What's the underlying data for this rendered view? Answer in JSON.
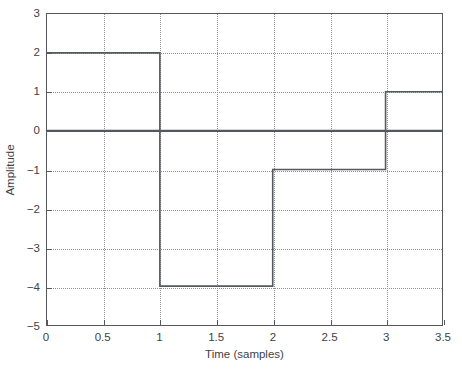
{
  "chart_data": {
    "type": "line",
    "subtype": "step",
    "title": "",
    "xlabel": "Time (samples)",
    "ylabel": "Amplitude",
    "xlim": [
      0,
      3.5
    ],
    "ylim": [
      -5,
      3
    ],
    "grid": true,
    "legend": "none",
    "xticks": [
      0,
      0.5,
      1,
      1.5,
      2,
      2.5,
      3,
      3.5
    ],
    "xtick_labels": [
      "0",
      "0.5",
      "1",
      "1.5",
      "2",
      "2.5",
      "3",
      "3.5"
    ],
    "yticks": [
      3,
      2,
      1,
      0,
      -1,
      -2,
      -3,
      -4,
      -5
    ],
    "ytick_labels": [
      "3",
      "2",
      "1",
      "0",
      "−1",
      "−2",
      "−3",
      "−4",
      "−5"
    ],
    "series": [
      {
        "name": "step-signal",
        "color": "#55585c",
        "steps": [
          {
            "x_start": 0,
            "x_end": 1,
            "value": 2
          },
          {
            "x_start": 1,
            "x_end": 2,
            "value": -4
          },
          {
            "x_start": 2,
            "x_end": 3,
            "value": -1
          },
          {
            "x_start": 3,
            "x_end": 3.5,
            "value": 1
          }
        ],
        "x": [
          0,
          1,
          1,
          2,
          2,
          3,
          3,
          3.5
        ],
        "y": [
          2,
          2,
          -4,
          -4,
          -1,
          -1,
          1,
          1
        ]
      },
      {
        "name": "zero-axis-line",
        "color": "#55585c",
        "x": [
          0,
          3.5
        ],
        "y": [
          0,
          0
        ]
      }
    ]
  },
  "axes": {
    "x_title": "Time (samples)",
    "y_title": "Amplitude"
  },
  "colors": {
    "line": "#55585c",
    "grid": "#8d9095",
    "frame": "#55585c",
    "text": "#3f4145",
    "background": "#ffffff"
  }
}
